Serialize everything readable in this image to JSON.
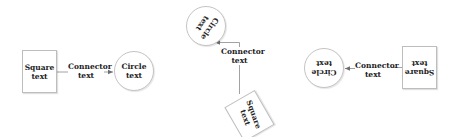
{
  "colors": {
    "node_border": "#bdbdbd",
    "line": "#8a8a8a",
    "text": "#222222",
    "background": "#ffffff"
  },
  "diagrams": [
    {
      "orientation": "0deg",
      "square": {
        "line1": "Square",
        "line2": "text"
      },
      "connector": {
        "line1": "Connector",
        "line2": "text"
      },
      "circle": {
        "line1": "Circle",
        "line2": "text"
      }
    },
    {
      "orientation": "rotated",
      "square": {
        "line1": "Square",
        "line2": "text"
      },
      "connector": {
        "line1": "Connector",
        "line2": "text"
      },
      "circle": {
        "line1": "Circle",
        "line2": "text"
      }
    },
    {
      "orientation": "180deg",
      "square": {
        "line1": "Square",
        "line2": "text"
      },
      "connector": {
        "line1": "Connector",
        "line2": "text"
      },
      "circle": {
        "line1": "Circle",
        "line2": "text"
      }
    }
  ]
}
